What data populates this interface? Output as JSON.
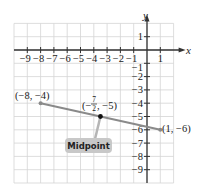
{
  "chart_data": {
    "type": "line",
    "title": "",
    "xlabel": "x",
    "ylabel": "y",
    "xlim": [
      -10,
      2
    ],
    "ylim": [
      -10,
      2
    ],
    "grid": true,
    "x_ticks": [
      -9,
      -8,
      -7,
      -6,
      -5,
      -4,
      -3,
      -2,
      -1,
      1
    ],
    "y_ticks": [
      1,
      -1,
      -2,
      -3,
      -4,
      -5,
      -6,
      -7,
      -8,
      -9
    ],
    "series": [
      {
        "name": "segment",
        "points": [
          {
            "x": -8,
            "y": -4,
            "label": "(−8, −4)"
          },
          {
            "x": 1,
            "y": -6,
            "label": "(1, −6)"
          }
        ],
        "color": "#8a8a8a"
      }
    ],
    "midpoint": {
      "x": -3.5,
      "y": -5,
      "label_num": "7",
      "label_den": "2",
      "label_prefix": "(−",
      "label_suffix": ", −5)"
    },
    "annotations": [
      {
        "text": "Midpoint",
        "target": "midpoint",
        "box_color": "#c8c8c8"
      }
    ]
  },
  "labels": {
    "x_axis": "x",
    "y_axis": "y",
    "point_a": "(−8, −4)",
    "point_b": "(1, −6)",
    "mid_open": "(−",
    "mid_num": "7",
    "mid_den": "2",
    "mid_close": ", −5)",
    "callout": "Midpoint"
  },
  "x_tick_labels": [
    "−9",
    "−8",
    "−7",
    "−6",
    "−5",
    "−4",
    "−3",
    "−2",
    "−1",
    "1"
  ],
  "y_tick_labels": [
    "1",
    "−1",
    "−2",
    "−3",
    "−4",
    "−5",
    "−6",
    "−7",
    "−8",
    "−9"
  ]
}
